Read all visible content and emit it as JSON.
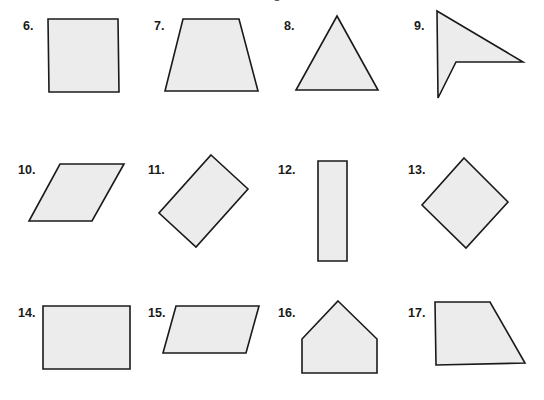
{
  "worksheet": {
    "fill_color": "#ececec",
    "stroke_color": "#1a1a1a",
    "figures": [
      {
        "number": "6.",
        "label": "6.",
        "shape": "square"
      },
      {
        "number": "7.",
        "label": "7.",
        "shape": "trapezoid"
      },
      {
        "number": "8.",
        "label": "8.",
        "shape": "triangle"
      },
      {
        "number": "9.",
        "label": "9.",
        "shape": "concave-quadrilateral"
      },
      {
        "number": "10.",
        "label": "10.",
        "shape": "parallelogram"
      },
      {
        "number": "11.",
        "label": "11.",
        "shape": "rotated-rectangle"
      },
      {
        "number": "12.",
        "label": "12.",
        "shape": "tall-rectangle"
      },
      {
        "number": "13.",
        "label": "13.",
        "shape": "rhombus"
      },
      {
        "number": "14.",
        "label": "14.",
        "shape": "rectangle"
      },
      {
        "number": "15.",
        "label": "15.",
        "shape": "parallelogram"
      },
      {
        "number": "16.",
        "label": "16.",
        "shape": "pentagon"
      },
      {
        "number": "17.",
        "label": "17.",
        "shape": "right-trapezoid"
      }
    ]
  }
}
